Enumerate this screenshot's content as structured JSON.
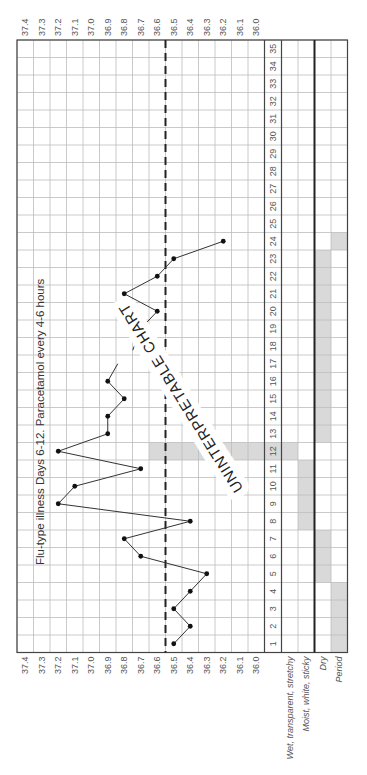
{
  "chart_data": {
    "type": "line",
    "orientation": "rotated-90-ccw",
    "title": "",
    "xlabel": "Cycle day",
    "ylabel": "Temperature (°C)",
    "ylim": [
      36.0,
      37.4
    ],
    "y_ticks": [
      "37.4",
      "37.3",
      "37.2",
      "37.1",
      "37.0",
      "36.9",
      "36.8",
      "36.7",
      "36.6",
      "36.5",
      "36.4",
      "36.3",
      "36.2",
      "36.1",
      "36.0"
    ],
    "x": [
      1,
      2,
      3,
      4,
      5,
      6,
      7,
      8,
      9,
      10,
      11,
      12,
      13,
      14,
      15,
      16,
      17,
      18,
      19,
      20,
      21,
      22,
      23,
      24,
      25,
      26,
      27,
      28,
      29,
      30,
      31,
      32,
      33,
      34,
      35
    ],
    "series": [
      {
        "name": "Basal body temperature",
        "points": [
          [
            1,
            36.5
          ],
          [
            2,
            36.4
          ],
          [
            3,
            36.5
          ],
          [
            4,
            36.4
          ],
          [
            5,
            36.3
          ],
          [
            6,
            36.7
          ],
          [
            7,
            36.8
          ],
          [
            8,
            36.4
          ],
          [
            9,
            37.2
          ],
          [
            10,
            37.1
          ],
          [
            11,
            36.7
          ],
          [
            12,
            37.2
          ],
          [
            13,
            36.9
          ],
          [
            14,
            36.9
          ],
          [
            15,
            36.8
          ],
          [
            16,
            36.9
          ],
          [
            19,
            36.7
          ],
          [
            20,
            36.6
          ],
          [
            21,
            36.8
          ],
          [
            22,
            36.6
          ],
          [
            23,
            36.5
          ],
          [
            24,
            36.2
          ]
        ]
      }
    ],
    "coverline": 36.55,
    "highlighted_day": 12,
    "annotations": [
      "Flu-type illness Days 6-12.  Paracetamol every 4-6 hours",
      "UNINTERPRETABLE CHART"
    ],
    "observation_rows": [
      {
        "label": "Wet, transparent, stretchy",
        "shaded_days": [
          12
        ]
      },
      {
        "label": "Moist, white, sticky",
        "shaded_days": [
          8,
          9,
          10,
          11
        ]
      },
      {
        "label": "Dry",
        "shaded_days": [
          5,
          6,
          7,
          13,
          14,
          15,
          16,
          17,
          18,
          19,
          20,
          21,
          22,
          23
        ]
      },
      {
        "label": "Period",
        "shaded_days": [
          1,
          2,
          3,
          4,
          24
        ]
      }
    ],
    "legend": "none",
    "grid": true
  },
  "labels": {
    "annotation_text": "Flu-type illness Days 6-12.  Paracetamol every 4-6 hours",
    "stamp_text": "UNINTERPRETABLE CHART"
  },
  "colors": {
    "grid_line": "#bdbdbd",
    "border": "#444444",
    "shading": "#d9d9d9",
    "line": "#333333",
    "text": "#555555"
  }
}
